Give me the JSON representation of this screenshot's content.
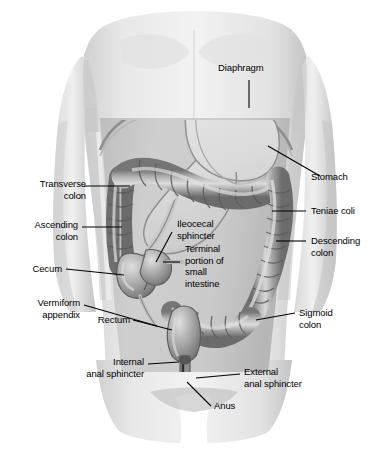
{
  "figure": {
    "style": "grayscale medical illustration",
    "colors": {
      "background": "#ffffff",
      "skin_light": "#ededed",
      "skin_mid": "#d9d9d9",
      "skin_shadow": "#bdbdbd",
      "abdomen_field": "#c9c9c9",
      "colon_light": "#d2d2d2",
      "colon_mid": "#9a9a9a",
      "colon_dark": "#6a6a6a",
      "stomach_fill": "#dcdcdc",
      "outline": "#4a4a4a",
      "label_text": "#000000",
      "leader_line": "#000000"
    }
  },
  "labels": [
    {
      "id": "diaphragm",
      "text": "Diaphragm",
      "side": "top"
    },
    {
      "id": "stomach",
      "text": "Stomach",
      "side": "right"
    },
    {
      "id": "teniae-coli",
      "text": "Teniae coli",
      "side": "right"
    },
    {
      "id": "descending-colon",
      "text": "Descending\ncolon",
      "side": "right"
    },
    {
      "id": "sigmoid-colon",
      "text": "Sigmoid\ncolon",
      "side": "right"
    },
    {
      "id": "external-anal-sphincter",
      "text": "External\nanal sphincter",
      "side": "right"
    },
    {
      "id": "anus",
      "text": "Anus",
      "side": "bottom"
    },
    {
      "id": "transverse-colon",
      "text": "Transverse\ncolon",
      "side": "left"
    },
    {
      "id": "ascending-colon",
      "text": "Ascending\ncolon",
      "side": "left"
    },
    {
      "id": "cecum",
      "text": "Cecum",
      "side": "left"
    },
    {
      "id": "vermiform-appendix",
      "text": "Vermiform\nappendix",
      "side": "left"
    },
    {
      "id": "rectum",
      "text": "Rectum",
      "side": "left"
    },
    {
      "id": "internal-anal-sphincter",
      "text": "Internal\nanal sphincter",
      "side": "left"
    },
    {
      "id": "ileocecal-sphincter",
      "text": "Ileocecal\nsphincter",
      "side": "center"
    },
    {
      "id": "terminal-ileum",
      "text": "Terminal\nportion of\nsmall\nintestine",
      "side": "center"
    }
  ]
}
